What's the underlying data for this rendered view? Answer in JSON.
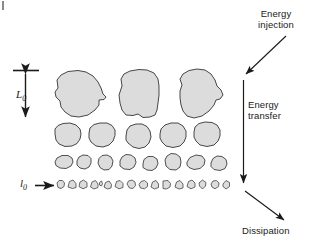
{
  "figure": {
    "type": "energy-cascade-diagram",
    "background_color": "#ffffff",
    "eddy_fill_color": "#dcdcdc",
    "eddy_stroke_color": "#333333",
    "text_color": "#1a1a1a",
    "arrow_color": "#1a1a1a"
  },
  "annotations": {
    "energy_injection": "Energy\ninjection",
    "energy_transfer": "Energy\ntransfer",
    "dissipation": "Dissipation"
  },
  "scale_labels": {
    "large_scale_symbol": "L",
    "large_scale_subscript": "0",
    "small_scale_symbol": "l",
    "small_scale_subscript": "0"
  },
  "cascade": {
    "rows": [
      {
        "name": "row-large-eddies",
        "scale": "L0",
        "count": 3,
        "description": "Largest energy-containing eddies of size L0"
      },
      {
        "name": "row-medium-eddies",
        "scale": "intermediate",
        "count": 5,
        "description": "Intermediate eddies produced by breakup of large eddies"
      },
      {
        "name": "row-small-eddies",
        "scale": "intermediate",
        "count": 8,
        "description": "Smaller eddies in the inertial subrange"
      },
      {
        "name": "row-dissipative-eddies",
        "scale": "l0",
        "count": 16,
        "description": "Smallest dissipative eddies of size l0"
      }
    ]
  },
  "arrows": {
    "energy_injection_arrow": {
      "name": "energy-injection-arrow",
      "direction": "down-left",
      "from": [
        286,
        37
      ],
      "to": [
        244,
        76
      ]
    },
    "energy_transfer_arrow": {
      "name": "energy-transfer-arrow",
      "direction": "down",
      "from": [
        243,
        80
      ],
      "to": [
        243,
        185
      ]
    },
    "dissipation_arrow": {
      "name": "dissipation-arrow",
      "direction": "down-right",
      "from": [
        245,
        190
      ],
      "to": [
        285,
        221
      ]
    },
    "small_scale_pointer_arrow": {
      "name": "small-scale-pointer-arrow",
      "direction": "right",
      "from": [
        36,
        185
      ],
      "to": [
        56,
        185
      ]
    },
    "large_scale_extent_arrow": {
      "name": "large-scale-extent-arrow",
      "direction": "vertical-double",
      "from": [
        25,
        72
      ],
      "to": [
        25,
        119
      ]
    }
  }
}
